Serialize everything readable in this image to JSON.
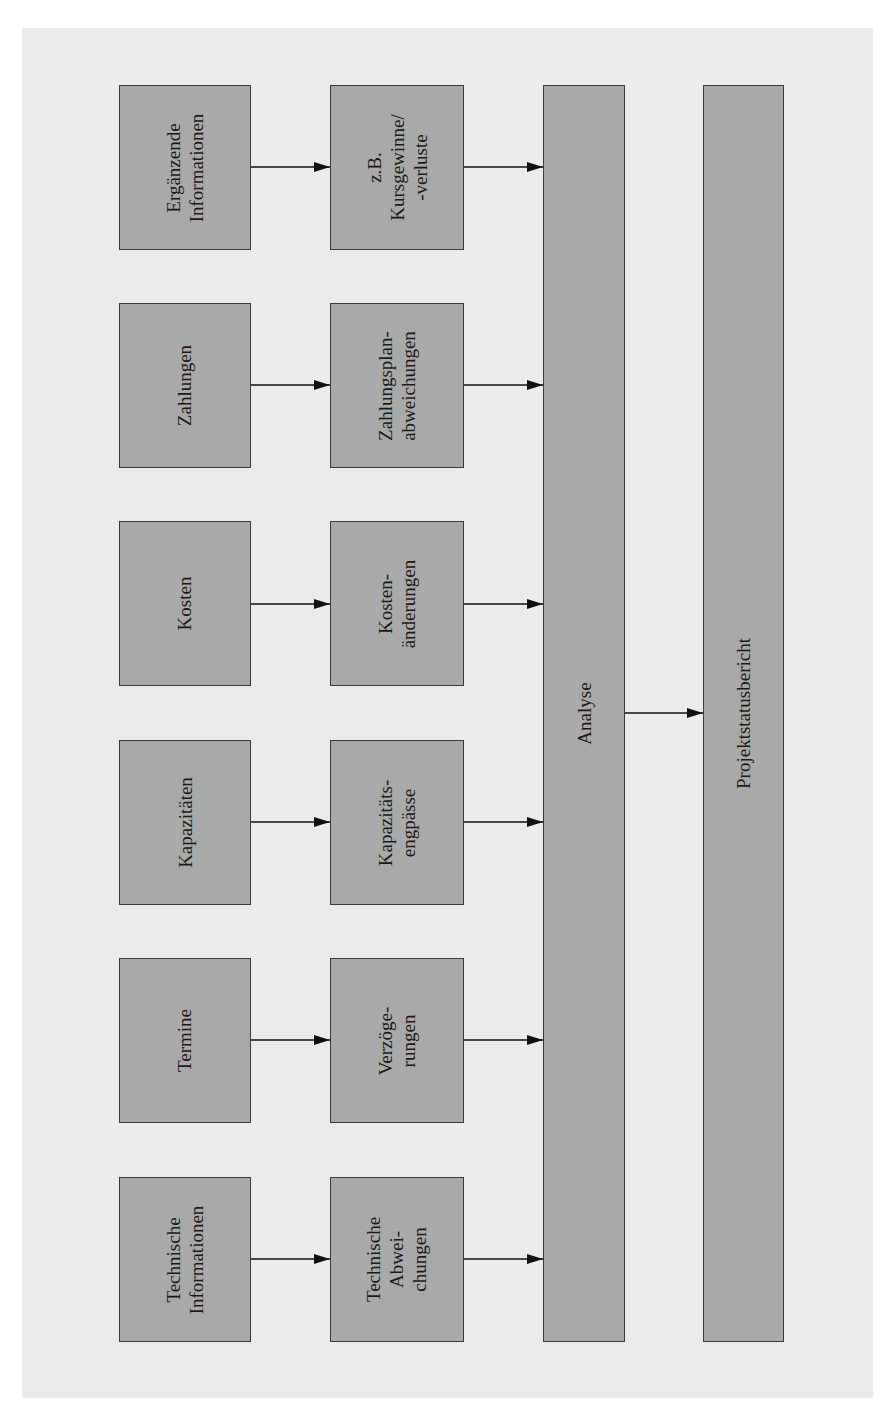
{
  "diagram": {
    "colors": {
      "background": "#ebebeb",
      "box_fill": "#a9a9a9",
      "box_border": "#3a3a3a",
      "arrow": "#111111"
    },
    "rows": [
      {
        "source": "Ergänzende\nInformationen",
        "deviation": "z.B.\nKursgewinne/\n-verluste"
      },
      {
        "source": "Zahlungen",
        "deviation": "Zahlungsplan-\nabweichungen"
      },
      {
        "source": "Kosten",
        "deviation": "Kosten-\nänderungen"
      },
      {
        "source": "Kapazitäten",
        "deviation": "Kapazitäts-\nengpässe"
      },
      {
        "source": "Termine",
        "deviation": "Verzöge-\nrungen"
      },
      {
        "source": "Technische\nInformationen",
        "deviation": "Technische\nAbwei-\nchungen"
      }
    ],
    "analysis": "Analyse",
    "report": "Projektstatusbericht"
  }
}
